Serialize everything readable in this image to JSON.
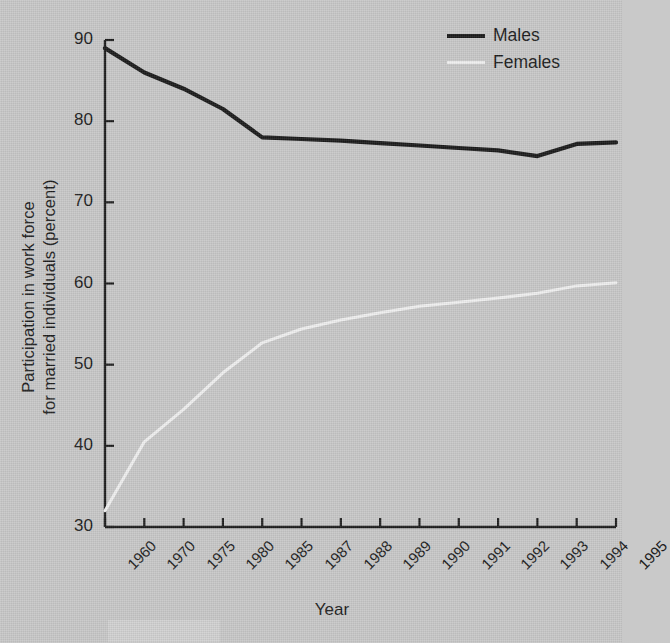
{
  "chart_data": {
    "type": "line",
    "title": "",
    "xlabel": "Year",
    "ylabel": "Participation in work force for married individuals (percent)",
    "ylabel_line1": "Participation in work force",
    "ylabel_line2": "for married individuals (percent)",
    "categories": [
      "1960",
      "1970",
      "1975",
      "1980",
      "1985",
      "1987",
      "1988",
      "1989",
      "1990",
      "1991",
      "1992",
      "1993",
      "1994",
      "1995"
    ],
    "ylim": [
      30,
      90
    ],
    "yticks": [
      30,
      40,
      50,
      60,
      70,
      80,
      90
    ],
    "grid": false,
    "legend_position": "top-right",
    "series": [
      {
        "name": "Males",
        "color": "#1a1a1a",
        "values": [
          89.0,
          86.0,
          84.0,
          81.5,
          78.0,
          77.8,
          77.6,
          77.3,
          77.0,
          76.7,
          76.4,
          75.7,
          77.2,
          77.4
        ]
      },
      {
        "name": "Females",
        "color": "#f0f0f0",
        "values": [
          32.0,
          40.5,
          44.5,
          49.0,
          52.7,
          54.4,
          55.5,
          56.4,
          57.2,
          57.7,
          58.2,
          58.8,
          59.7,
          60.1
        ]
      }
    ]
  },
  "legend": {
    "items": [
      {
        "label": "Males"
      },
      {
        "label": "Females"
      }
    ]
  },
  "axes": {
    "y_title_line1": "Participation in work force",
    "y_title_line2": "for married individuals (percent)",
    "x_title": "Year",
    "y_tick_labels": [
      "90",
      "80",
      "70",
      "60",
      "50",
      "40",
      "30"
    ],
    "x_tick_labels": [
      "1960",
      "1970",
      "1975",
      "1980",
      "1985",
      "1987",
      "1988",
      "1989",
      "1990",
      "1991",
      "1992",
      "1993",
      "1994",
      "1995"
    ]
  },
  "colors": {
    "background": "#c8c8c8",
    "axis": "#1c1c1c",
    "males_line": "#1a1a1a",
    "females_line": "#f0f0f0"
  }
}
